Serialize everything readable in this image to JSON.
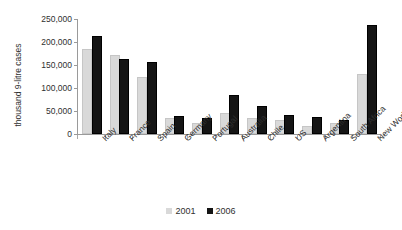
{
  "chart_data": {
    "type": "bar",
    "title": "",
    "subtitle": "",
    "xlabel": "",
    "ylabel": "thousand 9-litre cases",
    "ylim": [
      0,
      250000
    ],
    "ytick_labels": [
      "250,000",
      "200,000",
      "150,000",
      "100,000",
      "50,000",
      "0"
    ],
    "ytick_values": [
      250000,
      200000,
      150000,
      100000,
      50000,
      0
    ],
    "grid": false,
    "legend_position": "bottom-center",
    "orientation": "vertical",
    "grouping": "grouped",
    "categories": [
      "Italy",
      "France",
      "Spain",
      "Germany",
      "Portugal",
      "Australia",
      "Chile",
      "US",
      "Argentina",
      "South Africa",
      "New World"
    ],
    "series": [
      {
        "name": "2001",
        "color": "#d9d9d9",
        "values": [
          180000,
          168000,
          120000,
          30000,
          20000,
          41000,
          31000,
          27000,
          13000,
          20000,
          126000
        ]
      },
      {
        "name": "2006",
        "color": "#151515",
        "values": [
          208000,
          158000,
          153000,
          35000,
          31000,
          81000,
          56000,
          37000,
          33000,
          27000,
          232000
        ]
      }
    ],
    "legend": [
      "2001",
      "2006"
    ],
    "annotations": []
  },
  "axes": {
    "y_title": "thousand 9-litre cases"
  }
}
